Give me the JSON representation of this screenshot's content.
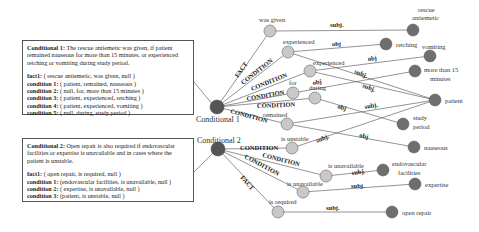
{
  "boxes": [
    {
      "title_bold": "Conditional 1:",
      "title_text": " The rescue antiemetic was given, if patient remained nauseous for more than 15 minutes, or experienced retching or vomiting during study period.",
      "rows": [
        {
          "k": "fact1:",
          "v": " ( rescue antiemetic, was given, null )"
        },
        {
          "k": "condition 1:",
          "v": " ( patient, remained, nauseous )"
        },
        {
          "k": "condition 2:",
          "v": " ( null, for, more than 15 minutes )"
        },
        {
          "k": "condition 3:",
          "v": " ( patient, experienced, retching )"
        },
        {
          "k": "condition 4:",
          "v": " ( patient, experienced, vomiting )"
        },
        {
          "k": "condition 5:",
          "v": " ( null, during, study period )"
        }
      ]
    },
    {
      "title_bold": "Conditional 2:",
      "title_text": " Open repair is also required if endovascular facilities or expertise is unavailable and in cases where the patient is unstable.",
      "rows": [
        {
          "k": "fact1:",
          "v": " ( open repair, is required, null )"
        },
        {
          "k": "condition 1:",
          "v": " (endovascular facilities, is unavailable, null )"
        },
        {
          "k": "condition 2:",
          "v": " ( expertise, is unavailable, null )"
        },
        {
          "k": "condition 3:",
          "v": " (patient, is unstable, null )"
        }
      ]
    }
  ],
  "graph": {
    "roots": [
      {
        "label": "Conditional 1",
        "x": 217,
        "y": 107
      },
      {
        "label": "Conditional 2",
        "x": 218,
        "y": 149
      }
    ],
    "relations": [
      {
        "label": "was given",
        "x": 270,
        "y": 31
      },
      {
        "label": "experienced",
        "x": 288,
        "y": 52
      },
      {
        "label": "experienced",
        "x": 310,
        "y": 71
      },
      {
        "label": "for",
        "x": 293,
        "y": 93
      },
      {
        "label": "during",
        "x": 315,
        "y": 98
      },
      {
        "label": "remained",
        "x": 287,
        "y": 124
      },
      {
        "label": "is unstable",
        "x": 292,
        "y": 148
      },
      {
        "label": "is unavailable",
        "x": 326,
        "y": 176
      },
      {
        "label": "is unavailable",
        "x": 303,
        "y": 192
      },
      {
        "label": "is required",
        "x": 278,
        "y": 212
      }
    ],
    "entities": [
      {
        "label": "rescue antiemetic",
        "x": 413,
        "y": 30
      },
      {
        "label": "retching",
        "x": 386,
        "y": 44
      },
      {
        "label": "vomiting",
        "x": 430,
        "y": 56
      },
      {
        "label": "more than 15 minutes",
        "x": 415,
        "y": 71
      },
      {
        "label": "patient",
        "x": 435,
        "y": 100
      },
      {
        "label": "study period",
        "x": 403,
        "y": 124
      },
      {
        "label": "nauseous",
        "x": 414,
        "y": 147
      },
      {
        "label": "endovascular facilities",
        "x": 383,
        "y": 170
      },
      {
        "label": "expertise",
        "x": 415,
        "y": 184
      },
      {
        "label": "open repair",
        "x": 392,
        "y": 212
      }
    ],
    "edges": [
      {
        "label": "FACT",
        "type": "root"
      },
      {
        "label": "CONDITION",
        "type": "root"
      },
      {
        "label": "subj.",
        "type": "rel"
      },
      {
        "label": "obj",
        "type": "rel"
      }
    ]
  }
}
